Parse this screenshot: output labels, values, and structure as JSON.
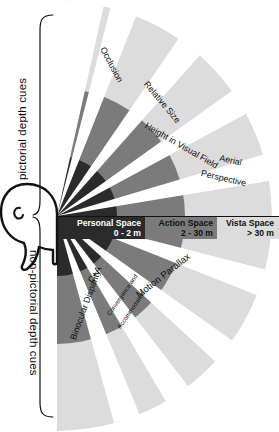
{
  "diagram": {
    "colors": {
      "personal_space": "#2b2b2b",
      "action_space": "#7b7b7b",
      "vista_space": "#dcdcdc",
      "wedge_gap": "#ffffff",
      "outline": "#111111",
      "label_dark": "#0d0d0d",
      "label_light": "#ffffff"
    },
    "brackets": [
      {
        "id": "pictorial",
        "label": "pictorial depth cues"
      },
      {
        "id": "non-pictorial",
        "label": "non-pictorial depth cues"
      }
    ],
    "rings": [
      {
        "id": "personal",
        "name": "Personal Space",
        "range": "0 - 2 m",
        "fill": "#2b2b2b",
        "text": "#ffffff"
      },
      {
        "id": "action",
        "name": "Action Space",
        "range": "2 - 30 m",
        "fill": "#7b7b7b",
        "text": "#111111"
      },
      {
        "id": "vista",
        "name": "Vista Space",
        "range": "> 30 m",
        "fill": "#dcdcdc",
        "text": "#111111"
      }
    ],
    "cues": [
      {
        "id": "occlusion",
        "label": "Occlusion",
        "group": "pictorial"
      },
      {
        "id": "relative-size",
        "label": "Relative Size",
        "group": "pictorial"
      },
      {
        "id": "height-visual",
        "label": "Height in Visual Field",
        "group": "pictorial"
      },
      {
        "id": "aerial-1",
        "label": "Aerial",
        "group": "pictorial"
      },
      {
        "id": "aerial-2",
        "label": "Perspective",
        "group": "pictorial"
      },
      {
        "id": "motion-parallax",
        "label": "Motion Parallax",
        "group": "non-pictorial"
      },
      {
        "id": "ca-abbrev",
        "label": "C+A",
        "group": "non-pictorial"
      },
      {
        "id": "ca-full-1",
        "label": "Convergence and",
        "group": "non-pictorial"
      },
      {
        "id": "ca-full-2",
        "label": "Accommodation",
        "group": "non-pictorial"
      },
      {
        "id": "binocular",
        "label": "Binocular Disparity",
        "group": "non-pictorial"
      }
    ],
    "observer": {
      "id": "head-profile",
      "label": "observer head profile"
    }
  }
}
